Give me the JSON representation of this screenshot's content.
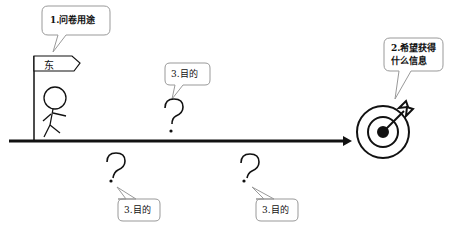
{
  "diagram": {
    "type": "process-metaphor",
    "colors": {
      "stroke": "#111111",
      "bubble_border": "#999999",
      "background": "#ffffff"
    },
    "start_figure": {
      "flag_label": "东",
      "callout": "1.问卷用途",
      "icon": "stick-figure-with-flag"
    },
    "goal": {
      "icon": "target-with-arrow",
      "callout_line1": "2.希望获得",
      "callout_line2": "什么信息"
    },
    "question_marks": [
      {
        "symbol": "?",
        "callout": "3.目的",
        "position": "above-line"
      },
      {
        "symbol": "?",
        "callout": "3.目的",
        "position": "below-line-left"
      },
      {
        "symbol": "?",
        "callout": "3.目的",
        "position": "below-line-right"
      }
    ]
  }
}
